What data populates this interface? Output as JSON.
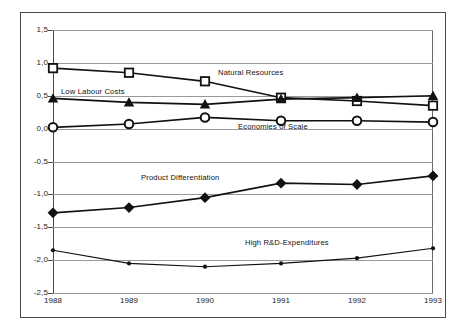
{
  "chart_data": {
    "type": "line",
    "title": "",
    "xlabel": "",
    "ylabel": "",
    "categories": [
      "1988",
      "1989",
      "1990",
      "1991",
      "1992",
      "1993"
    ],
    "ylim": [
      -2.5,
      1.5
    ],
    "yticks": [
      "1,5",
      "1,0",
      "0,5",
      "0,0",
      "-0,5",
      "-1,0",
      "-1,5",
      "-2,0",
      "-2,5"
    ],
    "ytick_values": [
      1.5,
      1.0,
      0.5,
      0.0,
      -0.5,
      -1.0,
      -1.5,
      -2.0,
      -2.5
    ],
    "grid": true,
    "legend": "inline-annotations",
    "series": [
      {
        "name": "Natural Resources",
        "marker": "square-open",
        "values": [
          0.92,
          0.85,
          0.72,
          0.47,
          0.42,
          0.35
        ]
      },
      {
        "name": "Low Labour Costs",
        "marker": "triangle-filled",
        "values": [
          0.46,
          0.4,
          0.37,
          0.45,
          0.47,
          0.5
        ]
      },
      {
        "name": "Economies of Scale",
        "marker": "circle-open",
        "values": [
          0.02,
          0.07,
          0.17,
          0.12,
          0.12,
          0.1
        ]
      },
      {
        "name": "Product Differentiation",
        "marker": "diamond-filled",
        "values": [
          -1.28,
          -1.2,
          -1.05,
          -0.83,
          -0.85,
          -0.72
        ]
      },
      {
        "name": "High R&D-Expenditures",
        "marker": "dot-small",
        "values": [
          -1.85,
          -2.05,
          -2.1,
          -2.05,
          -1.97,
          -1.82
        ]
      }
    ],
    "annotations": [
      {
        "text": "Natural Resources",
        "x": 218,
        "y": 68
      },
      {
        "text": "Low Labour Costs",
        "x": 61,
        "y": 87
      },
      {
        "text": "Economies of Scale",
        "x": 238,
        "y": 122
      },
      {
        "text": "Product Differentiation",
        "x": 141,
        "y": 173
      },
      {
        "text": "High R&D-Expenditures",
        "x": 245,
        "y": 238
      }
    ],
    "colors": {
      "line": "#111111",
      "grid": "#9a9a9a",
      "axis": "#4a4a4a",
      "background": "#ffffff",
      "frame": "#4a4a4a"
    }
  }
}
